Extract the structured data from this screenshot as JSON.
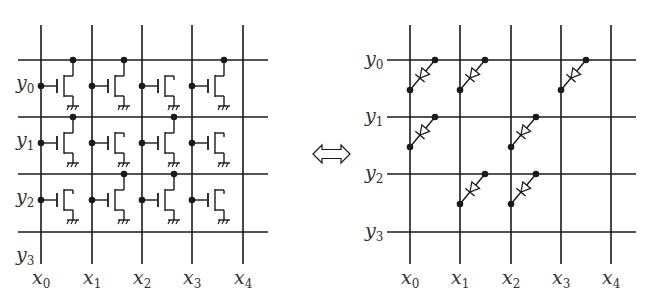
{
  "figure": {
    "equivalence_symbol": "double-arrow-icon",
    "colors": {
      "line": "#1a1a1a",
      "label": "#333333",
      "background": "#ffffff"
    }
  },
  "left_panel": {
    "title": "transistor crossbar",
    "column_labels": [
      {
        "base": "x",
        "sub": "0"
      },
      {
        "base": "x",
        "sub": "1"
      },
      {
        "base": "x",
        "sub": "2"
      },
      {
        "base": "x",
        "sub": "3"
      },
      {
        "base": "x",
        "sub": "4"
      }
    ],
    "row_labels": [
      {
        "base": "y",
        "sub": "0"
      },
      {
        "base": "y",
        "sub": "1"
      },
      {
        "base": "y",
        "sub": "2"
      },
      {
        "base": "y",
        "sub": "3"
      }
    ],
    "cells_connected_to_upper_line": [
      [
        1,
        1,
        0,
        1
      ],
      [
        1,
        0,
        1,
        0
      ],
      [
        0,
        1,
        1,
        0
      ]
    ]
  },
  "right_panel": {
    "title": "diode crossbar",
    "column_labels": [
      {
        "base": "x",
        "sub": "0"
      },
      {
        "base": "x",
        "sub": "1"
      },
      {
        "base": "x",
        "sub": "2"
      },
      {
        "base": "x",
        "sub": "3"
      },
      {
        "base": "x",
        "sub": "4"
      }
    ],
    "row_labels": [
      {
        "base": "y",
        "sub": "0"
      },
      {
        "base": "y",
        "sub": "1"
      },
      {
        "base": "y",
        "sub": "2"
      },
      {
        "base": "y",
        "sub": "3"
      }
    ],
    "diodes": [
      [
        1,
        1,
        0,
        1
      ],
      [
        1,
        0,
        1,
        0
      ],
      [
        0,
        1,
        1,
        0
      ]
    ]
  }
}
